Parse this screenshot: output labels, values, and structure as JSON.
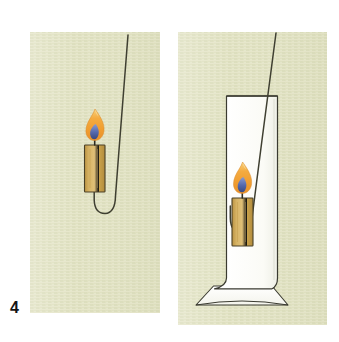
{
  "figure": {
    "number_label": "4",
    "caption": "",
    "panels": [
      {
        "id": "panel-open-air",
        "name": "candle-on-wire-in-open-air",
        "objects": [
          {
            "name": "wire-holder",
            "kind": "wire",
            "color": "#3a3a2e"
          },
          {
            "name": "candle-body",
            "kind": "candle",
            "color": "#c9a14a"
          },
          {
            "name": "candle-wick",
            "kind": "wick",
            "color": "#2b2b22"
          },
          {
            "name": "flame-outer",
            "kind": "flame",
            "color": "#f0a43c"
          },
          {
            "name": "flame-inner",
            "kind": "flame-core",
            "color": "#5b6fb0"
          }
        ]
      },
      {
        "id": "panel-in-cylinder",
        "name": "candle-on-wire-inside-glass-cylinder",
        "objects": [
          {
            "name": "glass-cylinder",
            "kind": "glass",
            "color": "#fdfdfb"
          },
          {
            "name": "cylinder-base",
            "kind": "glass-base",
            "color": "#fdfdfb"
          },
          {
            "name": "wire-holder",
            "kind": "wire",
            "color": "#3a3a2e"
          },
          {
            "name": "candle-body",
            "kind": "candle",
            "color": "#c9a14a"
          },
          {
            "name": "candle-wick",
            "kind": "wick",
            "color": "#2b2b22"
          },
          {
            "name": "flame-outer",
            "kind": "flame",
            "color": "#f0a43c"
          },
          {
            "name": "flame-inner",
            "kind": "flame-core",
            "color": "#5b6fb0"
          }
        ]
      }
    ]
  },
  "colors": {
    "page_background": "#ffffff",
    "panel_background": "#dfe0bf",
    "panel_background_light": "#e9eacd",
    "ink": "#2f2f26",
    "candle_wax": "#c9a14a",
    "candle_wax_light": "#d9b868",
    "candle_outline": "#4a4126",
    "flame_orange": "#f0a43c",
    "flame_orange_light": "#f6c56b",
    "flame_blue": "#5b6fb0",
    "glass_fill": "#fdfdfb",
    "glass_stroke": "#3a3a30",
    "label_color": "#141414"
  }
}
